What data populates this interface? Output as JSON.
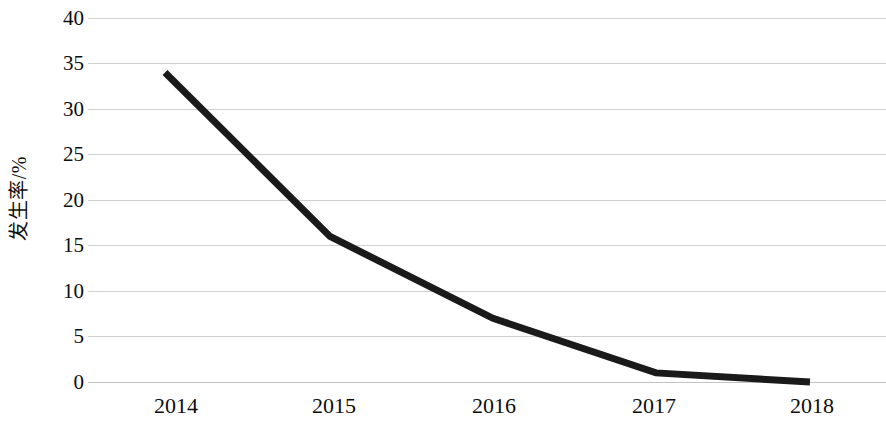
{
  "chart_data": {
    "type": "line",
    "title": "",
    "subtitle": "",
    "xlabel": "",
    "ylabel": "发生率/%",
    "categories": [
      "2014",
      "2015",
      "2016",
      "2017",
      "2018"
    ],
    "x": [
      2014,
      2015,
      2016,
      2017,
      2018
    ],
    "values": [
      34,
      16,
      7,
      1,
      0
    ],
    "series": [
      {
        "name": "发生率",
        "values": [
          34,
          16,
          7,
          1,
          0
        ],
        "color": "#1a1a1a",
        "line_width": 7,
        "markers": false
      }
    ],
    "ylim": [
      0,
      40
    ],
    "y_ticks": [
      0,
      5,
      10,
      15,
      20,
      25,
      30,
      35,
      40
    ],
    "y_tick_labels": [
      "0",
      "5",
      "10",
      "15",
      "20",
      "25",
      "30",
      "35",
      "40"
    ],
    "x_tick_labels": [
      "2014",
      "2015",
      "2016",
      "2017",
      "2018"
    ],
    "grid": true,
    "grid_axis": "y",
    "grid_color": "#c8c8c8",
    "legend": false,
    "legend_position": "none",
    "annotations": [],
    "background_color": "#ffffff",
    "axis_text_color": "#0d0d0d"
  },
  "axes": {
    "y_title": "发生率/%",
    "y_tick_labels": [
      "40",
      "35",
      "30",
      "25",
      "20",
      "15",
      "10",
      "5",
      "0"
    ],
    "x_tick_labels": [
      "2014",
      "2015",
      "2016",
      "2017",
      "2018"
    ]
  }
}
